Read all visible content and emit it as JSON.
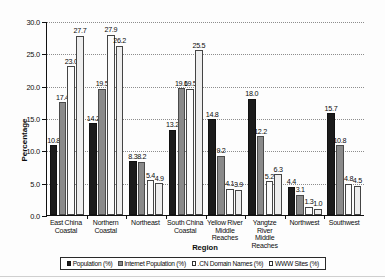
{
  "chart_data": {
    "type": "bar",
    "title": "",
    "xlabel": "Region",
    "ylabel": "Percentage",
    "ylim": [
      0,
      30
    ],
    "yticks": [
      "0.0",
      "5.0",
      "10.0",
      "15.0",
      "20.0",
      "25.0",
      "30.0"
    ],
    "ytick_values": [
      0,
      5,
      10,
      15,
      20,
      25,
      30
    ],
    "grid": true,
    "legend_position": "bottom",
    "categories": [
      "East China Coastal",
      "Northern Coastal",
      "Northeast",
      "South China Coastal",
      "Yellow River Middle Reaches",
      "Yangtze River Middle Reaches",
      "Northwest",
      "Southwest"
    ],
    "category_lines": [
      [
        "East China",
        "Coastal"
      ],
      [
        "Northern",
        "Coastal"
      ],
      [
        "Northeast"
      ],
      [
        "South China",
        "Coastal"
      ],
      [
        "Yellow River",
        "Middle",
        "Reaches"
      ],
      [
        "Yangtze River",
        "Middle",
        "Reaches"
      ],
      [
        "Northwest"
      ],
      [
        "Southwest"
      ]
    ],
    "series": [
      {
        "name": "Population (%)",
        "color": "#1b1b1b",
        "values": [
          10.8,
          14.2,
          8.3,
          13.2,
          14.8,
          18.0,
          4.4,
          15.7
        ],
        "labels": [
          "10.8",
          "14.2",
          "8.3",
          "13.2",
          "14.8",
          "18.0",
          "4.4",
          "15.7"
        ]
      },
      {
        "name": "Internet Population (%)",
        "color": "#8a8a8a",
        "values": [
          17.4,
          19.5,
          8.2,
          19.6,
          9.2,
          12.2,
          3.1,
          10.8
        ],
        "labels": [
          "17.4",
          "19.5",
          "8.2",
          "19.6",
          "9.2",
          "12.2",
          "3.1",
          "10.8"
        ]
      },
      {
        "name": ".CN Domain Names (%)",
        "color": "#fbfbfb",
        "values": [
          23.0,
          27.9,
          5.4,
          19.5,
          4.1,
          5.2,
          1.3,
          4.8
        ],
        "labels": [
          "23.0",
          "27.9",
          "5.4",
          "19.5",
          "4.1",
          "5.2",
          "1.3",
          "4.8"
        ]
      },
      {
        "name": "WWW Sites (%)",
        "color": "#eeeeee",
        "values": [
          27.7,
          26.2,
          4.9,
          25.5,
          3.9,
          6.3,
          1.0,
          4.5
        ],
        "labels": [
          "27.7",
          "26.2",
          "4.9",
          "25.5",
          "3.9",
          "6.3",
          "1.0",
          "4.5"
        ]
      }
    ]
  }
}
